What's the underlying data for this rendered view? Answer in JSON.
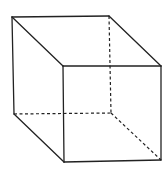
{
  "diagram": {
    "title": "",
    "type": "cube-wireframe",
    "stroke_color": "#222222",
    "background": "#ffffff",
    "vertices": {
      "back_top_left": [
        12,
        17
      ],
      "back_top_right": [
        109,
        16
      ],
      "back_bottom_left": [
        14,
        114
      ],
      "back_bottom_right": [
        111,
        113
      ],
      "front_top_left": [
        63,
        66
      ],
      "front_top_right": [
        161,
        66
      ],
      "front_bottom_left": [
        64,
        162
      ],
      "front_bottom_right": [
        161,
        160
      ]
    },
    "solid_edges": [
      [
        "back_top_left",
        "back_top_right"
      ],
      [
        "back_top_left",
        "back_bottom_left"
      ],
      [
        "back_top_left",
        "front_top_left"
      ],
      [
        "back_top_right",
        "front_top_right"
      ],
      [
        "back_bottom_left",
        "front_bottom_left"
      ],
      [
        "front_top_left",
        "front_top_right"
      ],
      [
        "front_top_right",
        "front_bottom_right"
      ],
      [
        "front_bottom_right",
        "front_bottom_left"
      ],
      [
        "front_bottom_left",
        "front_top_left"
      ]
    ],
    "hidden_edges": [
      [
        "back_top_right",
        "back_bottom_right"
      ],
      [
        "back_bottom_left",
        "back_bottom_right"
      ],
      [
        "back_bottom_right",
        "front_bottom_right"
      ]
    ]
  }
}
